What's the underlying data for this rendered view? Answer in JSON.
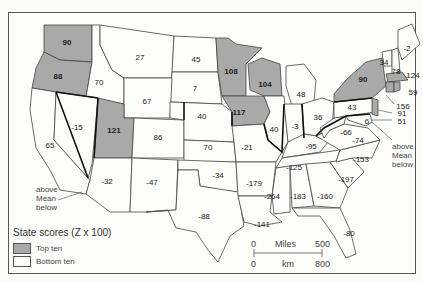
{
  "legend": {
    "title": "State scores (Z x 100)",
    "items": [
      {
        "label": "Top ten",
        "color": "#a9a9a9"
      },
      {
        "label": "Bottom ten",
        "color": "#fdfdfb"
      }
    ]
  },
  "mean_annotations": {
    "west": {
      "above": "above",
      "mean": "Mean",
      "below": "below"
    },
    "east": {
      "above": "above",
      "mean": "Mean",
      "below": "below"
    }
  },
  "scale": {
    "miles_label": "Miles",
    "miles_zero": "0",
    "miles_max": "500",
    "km_label": "km",
    "km_zero": "0",
    "km_max": "800"
  },
  "states": [
    {
      "name": "WA",
      "score": "90",
      "top": true
    },
    {
      "name": "OR",
      "score": "88",
      "top": true
    },
    {
      "name": "ID",
      "score": "70",
      "top": false
    },
    {
      "name": "MT",
      "score": "27",
      "top": false
    },
    {
      "name": "ND",
      "score": "45",
      "top": false
    },
    {
      "name": "MN",
      "score": "108",
      "top": true
    },
    {
      "name": "WI",
      "score": "104",
      "top": true
    },
    {
      "name": "MI",
      "score": "48",
      "top": false
    },
    {
      "name": "NY",
      "score": "90",
      "top": true
    },
    {
      "name": "ME",
      "score": "-2",
      "top": false
    },
    {
      "name": "VT",
      "score": "34",
      "top": false
    },
    {
      "name": "NH",
      "score": "78",
      "top": false
    },
    {
      "name": "MA",
      "score": "124",
      "top": true
    },
    {
      "name": "RI",
      "score": "59",
      "top": true
    },
    {
      "name": "CT",
      "score": "156",
      "top": true
    },
    {
      "name": "NJ",
      "score": "91",
      "top": true
    },
    {
      "name": "DE",
      "score": "51",
      "top": false
    },
    {
      "name": "MD",
      "score": "6",
      "top": false
    },
    {
      "name": "PA",
      "score": "43",
      "top": false
    },
    {
      "name": "OH",
      "score": "36",
      "top": false
    },
    {
      "name": "IN",
      "score": "-3",
      "top": false
    },
    {
      "name": "IL",
      "score": "40",
      "top": false
    },
    {
      "name": "IA",
      "score": "117",
      "top": true
    },
    {
      "name": "SD",
      "score": "7",
      "top": false
    },
    {
      "name": "WY",
      "score": "67",
      "top": false
    },
    {
      "name": "NV",
      "score": "-15",
      "top": false
    },
    {
      "name": "CA",
      "score": "65",
      "top": false
    },
    {
      "name": "UT",
      "score": "121",
      "top": true
    },
    {
      "name": "CO",
      "score": "86",
      "top": false
    },
    {
      "name": "NE",
      "score": "40",
      "top": false
    },
    {
      "name": "KS",
      "score": "70",
      "top": false
    },
    {
      "name": "MO",
      "score": "-21",
      "top": false
    },
    {
      "name": "KY",
      "score": "-95",
      "top": false
    },
    {
      "name": "WV",
      "score": "-66",
      "top": false
    },
    {
      "name": "VA",
      "score": "-74",
      "top": false
    },
    {
      "name": "NC",
      "score": "-153",
      "top": false
    },
    {
      "name": "TN",
      "score": "-125",
      "top": false
    },
    {
      "name": "SC",
      "score": "-197",
      "top": false
    },
    {
      "name": "AZ",
      "score": "-32",
      "top": false
    },
    {
      "name": "NM",
      "score": "-47",
      "top": false
    },
    {
      "name": "OK",
      "score": "-34",
      "top": false
    },
    {
      "name": "TX",
      "score": "-88",
      "top": false
    },
    {
      "name": "AR",
      "score": "-179",
      "top": false
    },
    {
      "name": "LA",
      "score": "-141",
      "top": false
    },
    {
      "name": "MS",
      "score": "-264",
      "top": false
    },
    {
      "name": "AL",
      "score": "-183",
      "top": false
    },
    {
      "name": "GA",
      "score": "-160",
      "top": false
    },
    {
      "name": "FL",
      "score": "-80",
      "top": false
    }
  ]
}
